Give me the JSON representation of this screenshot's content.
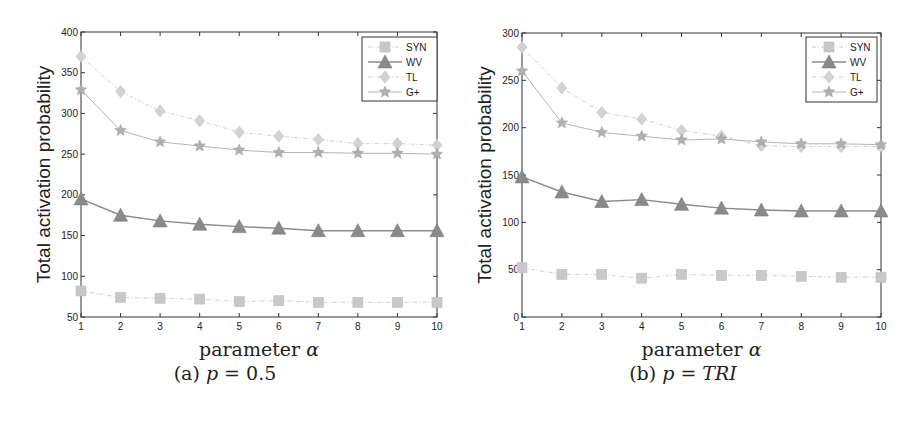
{
  "figure": {
    "panels": [
      {
        "caption": "(a) p = 0.5",
        "caption_parts": [
          "(a) ",
          "p",
          " = 0.5"
        ]
      },
      {
        "caption": "(b) p = TRI",
        "caption_parts": [
          "(b) ",
          "p",
          " = ",
          "TRI"
        ]
      }
    ]
  },
  "chart_data": [
    {
      "type": "line",
      "title": "",
      "subtitle": "(a) p = 0.5",
      "xlabel": "parameter α",
      "ylabel": "Total activation probability",
      "x": [
        1,
        2,
        3,
        4,
        5,
        6,
        7,
        8,
        9,
        10
      ],
      "xlim": [
        1,
        10
      ],
      "ylim": [
        50,
        400
      ],
      "yticks": [
        50,
        100,
        150,
        200,
        250,
        300,
        350,
        400
      ],
      "xticks": [
        1,
        2,
        3,
        4,
        5,
        6,
        7,
        8,
        9,
        10
      ],
      "grid": false,
      "legend_position": "upper right",
      "series": [
        {
          "name": "SYN",
          "marker": "square",
          "color": "#c8c8c8",
          "line": "dashdot",
          "values": [
            82,
            74,
            73,
            72,
            69,
            70,
            68,
            68,
            68,
            68
          ]
        },
        {
          "name": "WV",
          "marker": "triangle",
          "color": "#8a8a8a",
          "line": "solid",
          "values": [
            195,
            175,
            168,
            164,
            161,
            159,
            156,
            156,
            156,
            156
          ]
        },
        {
          "name": "TL",
          "marker": "diamond",
          "color": "#d2d2d2",
          "line": "dashdot",
          "values": [
            370,
            327,
            303,
            291,
            277,
            272,
            268,
            263,
            263,
            261
          ]
        },
        {
          "name": "G+",
          "marker": "star",
          "color": "#b0b0b0",
          "line": "solid",
          "values": [
            329,
            279,
            265,
            260,
            255,
            252,
            252,
            251,
            251,
            250
          ]
        }
      ]
    },
    {
      "type": "line",
      "title": "",
      "subtitle": "(b) p = TRI",
      "xlabel": "parameter α",
      "ylabel": "Total activation probability",
      "x": [
        1,
        2,
        3,
        4,
        5,
        6,
        7,
        8,
        9,
        10
      ],
      "xlim": [
        1,
        10
      ],
      "ylim": [
        0,
        300
      ],
      "yticks": [
        0,
        50,
        100,
        150,
        200,
        250,
        300
      ],
      "xticks": [
        1,
        2,
        3,
        4,
        5,
        6,
        7,
        8,
        9,
        10
      ],
      "grid": false,
      "legend_position": "upper right",
      "series": [
        {
          "name": "SYN",
          "marker": "square",
          "color": "#c8c8c8",
          "line": "dashdot",
          "values": [
            52,
            45,
            45,
            41,
            45,
            44,
            44,
            43,
            42,
            42
          ]
        },
        {
          "name": "WV",
          "marker": "triangle",
          "color": "#8a8a8a",
          "line": "solid",
          "values": [
            148,
            132,
            122,
            124,
            119,
            115,
            113,
            112,
            112,
            112
          ]
        },
        {
          "name": "TL",
          "marker": "diamond",
          "color": "#d2d2d2",
          "line": "dashdot",
          "values": [
            285,
            242,
            216,
            209,
            197,
            191,
            181,
            180,
            180,
            180
          ]
        },
        {
          "name": "G+",
          "marker": "star",
          "color": "#b0b0b0",
          "line": "solid",
          "values": [
            260,
            205,
            195,
            191,
            187,
            188,
            185,
            183,
            183,
            182
          ]
        }
      ]
    }
  ]
}
